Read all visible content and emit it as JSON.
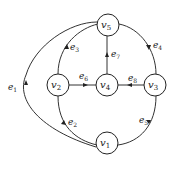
{
  "diagram": {
    "type": "directed-graph",
    "nodes": [
      {
        "id": "v1",
        "label": "v",
        "sub": "1",
        "x": 107,
        "y": 143
      },
      {
        "id": "v2",
        "label": "v",
        "sub": "2",
        "x": 58,
        "y": 85
      },
      {
        "id": "v3",
        "label": "v",
        "sub": "3",
        "x": 155,
        "y": 85
      },
      {
        "id": "v4",
        "label": "v",
        "sub": "4",
        "x": 107,
        "y": 85
      },
      {
        "id": "v5",
        "label": "v",
        "sub": "5",
        "x": 108,
        "y": 25
      }
    ],
    "edges": [
      {
        "id": "e1",
        "label": "e",
        "sub": "1",
        "from": "v1",
        "to": "v5"
      },
      {
        "id": "e2",
        "label": "e",
        "sub": "2",
        "from": "v1",
        "to": "v2"
      },
      {
        "id": "e3",
        "label": "e",
        "sub": "3",
        "from": "v2",
        "to": "v5"
      },
      {
        "id": "e4",
        "label": "e",
        "sub": "4",
        "from": "v5",
        "to": "v3"
      },
      {
        "id": "e5",
        "label": "e",
        "sub": "5",
        "from": "v3",
        "to": "v1"
      },
      {
        "id": "e6",
        "label": "e",
        "sub": "6",
        "from": "v2",
        "to": "v4"
      },
      {
        "id": "e7",
        "label": "e",
        "sub": "7",
        "from": "v4",
        "to": "v5"
      },
      {
        "id": "e8",
        "label": "e",
        "sub": "8",
        "from": "v3",
        "to": "v4"
      }
    ]
  }
}
